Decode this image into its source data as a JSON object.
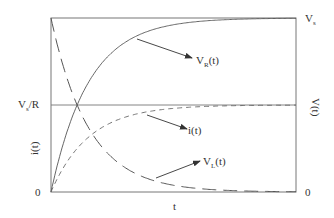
{
  "chart_data": {
    "type": "line",
    "title": "",
    "xlabel": "t",
    "ylabel_left": "i(t)",
    "ylabel_right": "V(t)",
    "left_ticks": [
      {
        "label": "V_s/R",
        "main": "V",
        "sub": "s",
        "rest": "/R",
        "value": 1.0
      },
      {
        "label": "0",
        "value": 0
      }
    ],
    "right_ticks": [
      {
        "label": "V_s",
        "main": "V",
        "sub": "s",
        "value": 1.0
      },
      {
        "label": "0",
        "value": 0
      }
    ],
    "x_range": [
      0,
      6.5
    ],
    "time_constant": 1.0,
    "series": [
      {
        "name": "V_R(t)",
        "main": "V",
        "sub": "R",
        "rest": "(t)",
        "style": "solid",
        "formula": "Vs*(1-exp(-t/tau))",
        "axis": "right",
        "y_at": {
          "0": 0,
          "1": 0.63,
          "2": 0.86,
          "3": 0.95,
          "5": 0.99
        }
      },
      {
        "name": "i(t)",
        "main": "i(t)",
        "sub": "",
        "rest": "",
        "style": "short-dash",
        "formula": "(Vs/R)*(1-exp(-t/tau))",
        "axis": "left",
        "y_at": {
          "0": 0,
          "1": 0.63,
          "2": 0.86,
          "3": 0.95,
          "5": 0.99
        }
      },
      {
        "name": "V_L(t)",
        "main": "V",
        "sub": "L",
        "rest": "(t)",
        "style": "long-dash",
        "formula": "Vs*exp(-t/tau)",
        "axis": "right",
        "y_at": {
          "0": 1.0,
          "1": 0.37,
          "2": 0.14,
          "3": 0.05,
          "5": 0.01
        }
      }
    ],
    "reference_line": {
      "label": "V_s/R",
      "value": 1.0
    },
    "grid": false,
    "legend": "arrow annotations"
  },
  "labels": {
    "x_axis": "t",
    "left_axis": "i(t)",
    "right_axis": "V(t)",
    "left_top_main": "V",
    "left_top_sub": "s",
    "left_top_rest": "/R",
    "left_zero": "0",
    "right_top_main": "V",
    "right_top_sub": "s",
    "right_zero": "0",
    "vr_main": "V",
    "vr_sub": "R",
    "vr_rest": "(t)",
    "it": "i(t)",
    "vl_main": "V",
    "vl_sub": "L",
    "vl_rest": "(t)"
  },
  "colors": {
    "line": "#555555",
    "frame": "#666666",
    "text": "#333333"
  }
}
